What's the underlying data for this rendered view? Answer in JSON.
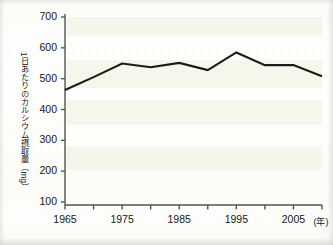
{
  "chart_data": {
    "type": "line",
    "title": "",
    "subtitle": "",
    "xlabel": "(年)",
    "ylabel": "1日あたりのカルシウム摂取量（mg）",
    "x": [
      1965,
      1970,
      1975,
      1980,
      1985,
      1990,
      1995,
      2000,
      2005,
      2010
    ],
    "values": [
      463,
      505,
      549,
      537,
      551,
      528,
      585,
      544,
      544,
      508
    ],
    "series": [
      {
        "name": "1日あたりのカルシウム摂取量",
        "values": [
          463,
          505,
          549,
          537,
          551,
          528,
          585,
          544,
          544,
          508
        ]
      }
    ],
    "xlim": [
      1965,
      2010
    ],
    "ylim": [
      100,
      700
    ],
    "y_ticks": [
      100,
      200,
      300,
      400,
      500,
      600,
      700
    ],
    "x_ticks": [
      1965,
      1970,
      1975,
      1980,
      1985,
      1990,
      1995,
      2000,
      2005,
      2010
    ],
    "x_tick_labels": [
      "1965",
      "",
      "1975",
      "",
      "1985",
      "",
      "1995",
      "",
      "2005",
      ""
    ],
    "y_tick_labels": [
      "100",
      "200",
      "300",
      "400",
      "500",
      "600",
      "700"
    ],
    "grid": false,
    "legend": null,
    "legend_position": "none",
    "line_color": "#1a1a1a",
    "axis_color": "#4a4a46",
    "background_color": "#fdfdfb",
    "band_color": "#f3f3e6",
    "annotations": []
  },
  "axes": {
    "y_title": "1日あたりのカルシウム摂取量（mg）",
    "x_unit_label": "(年)"
  }
}
